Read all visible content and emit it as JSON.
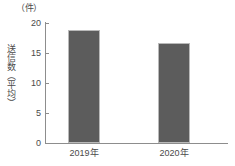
{
  "chart_data": {
    "type": "bar",
    "title": "",
    "subtitle": "",
    "unit_label": "（件）",
    "ylabel": "送信数（平均）",
    "xlabel": "",
    "categories": [
      "2019年",
      "2020年"
    ],
    "values": [
      18.8,
      16.7
    ],
    "ylim": [
      0,
      20
    ],
    "yticks": [
      0,
      5,
      10,
      15,
      20
    ],
    "ytick_labels": [
      "0",
      "5",
      "10",
      "15",
      "20"
    ],
    "grid": false,
    "legend": false,
    "legend_position": "none",
    "bar_color": "#5c5c5c",
    "bar_border_color": "#b9b9b9",
    "axis_color": "#8d8d8d",
    "text_color": "#4a4a4a",
    "background_color": "#ffffff"
  }
}
